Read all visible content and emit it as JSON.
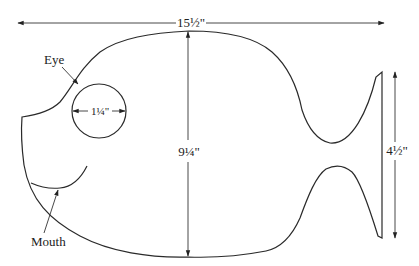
{
  "diagram": {
    "dimensions": {
      "overall_length": "15½\"",
      "body_height": "9¼\"",
      "eye_diameter": "1¼\"",
      "tail_height": "4½\""
    },
    "labels": {
      "eye": "Eye",
      "mouth": "Mouth"
    },
    "colors": {
      "stroke": "#2a2a2a",
      "background": "#ffffff"
    }
  }
}
